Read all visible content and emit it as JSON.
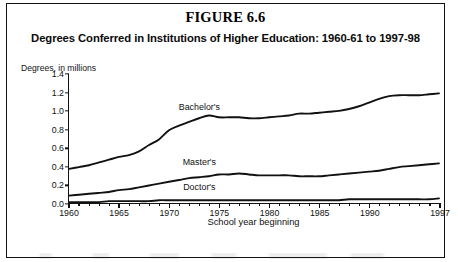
{
  "figure": {
    "title": "FIGURE 6.6",
    "subtitle": "Degrees Conferred in Institutions of Higher Education: 1960-61 to 1997-98"
  },
  "chart_data": {
    "type": "line",
    "title": "Degrees Conferred in Institutions of Higher Education: 1960-61 to 1997-98",
    "ylabel": "Degrees, in millions",
    "xlabel": "School year beginning",
    "xlim": [
      1960,
      1997
    ],
    "ylim": [
      0.0,
      1.4
    ],
    "grid": false,
    "legend_position": "inline-right",
    "ytick_labels": [
      "1.4",
      "1.2",
      "1.0",
      "0.8",
      "0.6",
      "0.4",
      "0.2",
      "0.0"
    ],
    "ytick_values": [
      1.4,
      1.2,
      1.0,
      0.8,
      0.6,
      0.4,
      0.2,
      0.0
    ],
    "xtick_labels": [
      "1960",
      "1965",
      "1970",
      "1975",
      "1980",
      "1985",
      "1990",
      "1997"
    ],
    "xtick_values": [
      1960,
      1965,
      1970,
      1975,
      1980,
      1985,
      1990,
      1997
    ],
    "x": [
      1960,
      1961,
      1962,
      1963,
      1964,
      1965,
      1966,
      1967,
      1968,
      1969,
      1970,
      1971,
      1972,
      1973,
      1974,
      1975,
      1976,
      1977,
      1978,
      1979,
      1980,
      1981,
      1982,
      1983,
      1984,
      1985,
      1986,
      1987,
      1988,
      1989,
      1990,
      1991,
      1992,
      1993,
      1994,
      1995,
      1996,
      1997
    ],
    "series": [
      {
        "name": "Bachelor's",
        "label": "Bachelor's",
        "label_x": 1973.0,
        "label_y": 1.04,
        "values": [
          0.37,
          0.39,
          0.41,
          0.44,
          0.47,
          0.5,
          0.52,
          0.56,
          0.63,
          0.69,
          0.79,
          0.84,
          0.88,
          0.92,
          0.95,
          0.93,
          0.93,
          0.93,
          0.92,
          0.92,
          0.93,
          0.94,
          0.95,
          0.97,
          0.97,
          0.98,
          0.99,
          1.0,
          1.02,
          1.05,
          1.09,
          1.13,
          1.16,
          1.17,
          1.17,
          1.17,
          1.18,
          1.19
        ]
      },
      {
        "name": "Master's",
        "label": "Master's",
        "label_x": 1973.0,
        "label_y": 0.45,
        "values": [
          0.08,
          0.09,
          0.1,
          0.11,
          0.12,
          0.14,
          0.15,
          0.17,
          0.19,
          0.21,
          0.23,
          0.25,
          0.27,
          0.28,
          0.29,
          0.31,
          0.31,
          0.32,
          0.31,
          0.3,
          0.3,
          0.3,
          0.3,
          0.29,
          0.29,
          0.29,
          0.3,
          0.31,
          0.32,
          0.33,
          0.34,
          0.35,
          0.37,
          0.39,
          0.4,
          0.41,
          0.42,
          0.43
        ]
      },
      {
        "name": "Doctor's",
        "label": "Doctor's",
        "label_x": 1973.0,
        "label_y": 0.18,
        "values": [
          0.01,
          0.01,
          0.01,
          0.01,
          0.02,
          0.02,
          0.02,
          0.02,
          0.02,
          0.03,
          0.03,
          0.03,
          0.03,
          0.03,
          0.03,
          0.03,
          0.03,
          0.03,
          0.03,
          0.03,
          0.03,
          0.03,
          0.03,
          0.03,
          0.03,
          0.03,
          0.03,
          0.03,
          0.04,
          0.04,
          0.04,
          0.04,
          0.04,
          0.04,
          0.04,
          0.04,
          0.04,
          0.05
        ]
      }
    ]
  }
}
